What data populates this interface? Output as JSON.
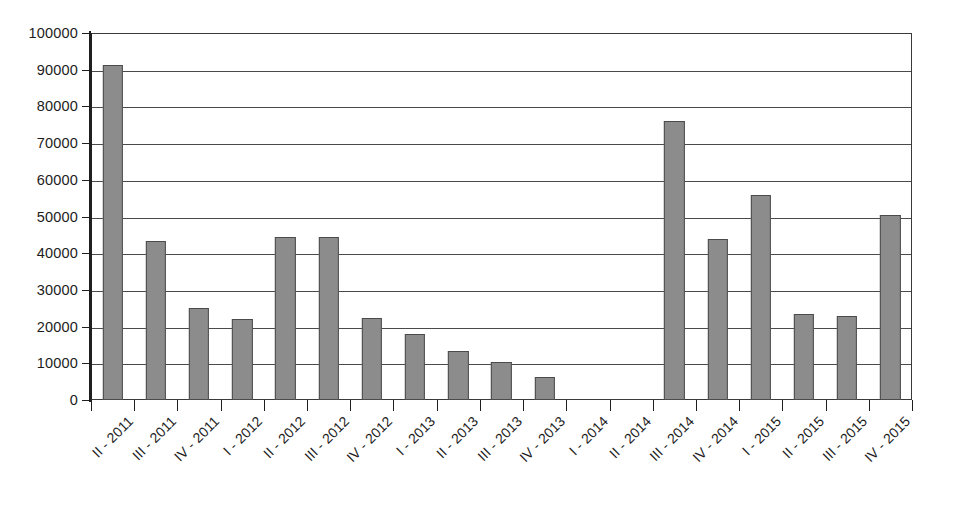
{
  "chart_data": {
    "type": "bar",
    "title": "",
    "subtitle": "",
    "xlabel": "",
    "ylabel": "",
    "ylim": [
      0,
      100000
    ],
    "ytick_step": 10000,
    "ytick_labels": [
      "100000",
      "90000",
      "80000",
      "70000",
      "60000",
      "50000",
      "40000",
      "30000",
      "20000",
      "10000",
      "0"
    ],
    "ytick_values": [
      100000,
      90000,
      80000,
      70000,
      60000,
      50000,
      40000,
      30000,
      20000,
      10000,
      0
    ],
    "grid": true,
    "legend": false,
    "legend_position": "none",
    "bar_color": "#8c8c8c",
    "bar_border_color": "#4b4b4b",
    "axis_color": "#1f1f1f",
    "grid_color": "#4a4a4a",
    "categories": [
      "II - 2011",
      "III - 2011",
      "IV - 2011",
      "I - 2012",
      "II - 2012",
      "III - 2012",
      "IV - 2012",
      "I - 2013",
      "II - 2013",
      "III - 2013",
      "IV - 2013",
      "I - 2014",
      "II - 2014",
      "III - 2014",
      "IV - 2014",
      "I - 2015",
      "II - 2015",
      "III - 2015",
      "IV - 2015"
    ],
    "values": [
      91200,
      43200,
      25000,
      22000,
      44500,
      44500,
      22400,
      18000,
      13400,
      10300,
      6400,
      0,
      0,
      76000,
      43800,
      55800,
      23400,
      22900,
      50400
    ]
  }
}
